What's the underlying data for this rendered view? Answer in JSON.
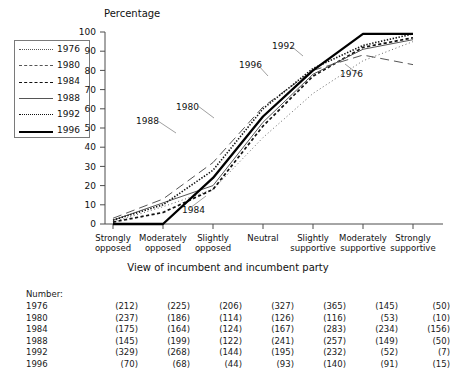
{
  "chart_data": {
    "type": "line",
    "title": "",
    "ylabel": "Percentage",
    "xlabel": "View of incumbent and incumbent party",
    "ylim": [
      0,
      100
    ],
    "ytick_values": [
      0,
      10,
      20,
      30,
      40,
      50,
      60,
      70,
      80,
      90,
      100
    ],
    "grid": false,
    "legend_position": "top-left",
    "categories": [
      "Strongly opposed",
      "Moderately opposed",
      "Slightly opposed",
      "Neutral",
      "Slightly supportive",
      "Moderately supportive",
      "Strongly supportive"
    ],
    "series": [
      {
        "name": "1976",
        "style": "fine-dotted",
        "values": [
          1,
          9,
          18,
          45,
          68,
          85,
          95
        ]
      },
      {
        "name": "1980",
        "style": "long-dashed",
        "values": [
          3,
          13,
          32,
          61,
          80,
          88,
          83
        ]
      },
      {
        "name": "1984",
        "style": "short-dashed",
        "values": [
          1,
          6,
          18,
          51,
          77,
          92,
          97
        ]
      },
      {
        "name": "1988",
        "style": "thin-solid",
        "values": [
          2,
          11,
          20,
          53,
          78,
          91,
          96
        ]
      },
      {
        "name": "1992",
        "style": "dotted",
        "values": [
          2,
          10,
          28,
          60,
          81,
          93,
          99
        ]
      },
      {
        "name": "1996",
        "style": "thick-solid",
        "values": [
          0,
          0,
          24,
          56,
          80,
          99,
          99
        ]
      }
    ],
    "annotations": [
      {
        "label": "1988",
        "x": 136,
        "y": 124
      },
      {
        "label": "1984",
        "x": 182,
        "y": 213
      },
      {
        "label": "1980",
        "x": 176,
        "y": 110
      },
      {
        "label": "1996",
        "x": 239,
        "y": 68
      },
      {
        "label": "1992",
        "x": 272,
        "y": 49
      },
      {
        "label": "1976",
        "x": 340,
        "y": 77
      }
    ]
  },
  "legend": {
    "items": [
      {
        "label": "1976",
        "style": "fine-dotted"
      },
      {
        "label": "1980",
        "style": "long-dashed"
      },
      {
        "label": "1984",
        "style": "short-dashed"
      },
      {
        "label": "1988",
        "style": "thin-solid"
      },
      {
        "label": "1992",
        "style": "dotted"
      },
      {
        "label": "1996",
        "style": "thick-solid"
      }
    ]
  },
  "number_table": {
    "caption": "Number:",
    "rows": [
      {
        "year": "1976",
        "values": [
          "(212)",
          "(225)",
          "(206)",
          "(327)",
          "(365)",
          "(145)",
          "(50)"
        ]
      },
      {
        "year": "1980",
        "values": [
          "(237)",
          "(186)",
          "(114)",
          "(126)",
          "(116)",
          "(53)",
          "(10)"
        ]
      },
      {
        "year": "1984",
        "values": [
          "(175)",
          "(164)",
          "(124)",
          "(167)",
          "(283)",
          "(234)",
          "(156)"
        ]
      },
      {
        "year": "1988",
        "values": [
          "(145)",
          "(199)",
          "(122)",
          "(241)",
          "(257)",
          "(149)",
          "(50)"
        ]
      },
      {
        "year": "1992",
        "values": [
          "(329)",
          "(268)",
          "(144)",
          "(195)",
          "(232)",
          "(52)",
          "(7)"
        ]
      },
      {
        "year": "1996",
        "values": [
          "(70)",
          "(68)",
          "(44)",
          "(93)",
          "(140)",
          "(91)",
          "(15)"
        ]
      }
    ]
  },
  "colors": {
    "axis": "#4d4d4d",
    "text": "#1a1a1a",
    "series_dark": "#000000",
    "series_mid": "#555555"
  }
}
